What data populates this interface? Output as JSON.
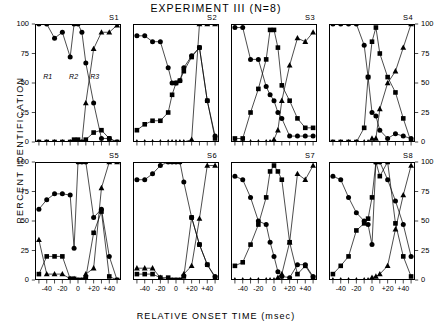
{
  "figure": {
    "title": "EXPERIMENT III (N=8)",
    "ylabel": "PERCENT IDENTIFICATION",
    "xlabel": "RELATIVE ONSET TIME (msec)",
    "ytick_labels": [
      "100",
      "75",
      "50",
      "25",
      "0"
    ],
    "ytick_values": [
      100,
      75,
      50,
      25,
      0
    ],
    "xtick_labels": [
      "-40",
      "-20",
      "0",
      "+20",
      "+40"
    ],
    "xtick_values": [
      -40,
      -20,
      0,
      20,
      40
    ],
    "region_labels": [
      "R1",
      "R2",
      "R3"
    ],
    "marker_names": [
      "circle",
      "square",
      "triangle"
    ]
  },
  "chart_data": {
    "type": "line",
    "title": "EXPERIMENT III (N=8)",
    "xlabel": "RELATIVE ONSET TIME (msec)",
    "ylabel": "PERCENT IDENTIFICATION",
    "xlim": [
      -55,
      55
    ],
    "ylim": [
      0,
      100
    ],
    "grid": false,
    "legend": "none",
    "annotations": [
      "R1",
      "R2",
      "R3"
    ],
    "x": [
      -50,
      -40,
      -30,
      -20,
      -10,
      -5,
      0,
      5,
      10,
      20,
      30,
      40,
      50
    ],
    "panels": [
      {
        "name": "S1",
        "series": [
          {
            "name": "R1",
            "marker": "circle",
            "values": [
              100,
              100,
              88,
              93,
              72,
              100,
              100,
              93,
              67,
              33,
              3,
              3,
              0
            ]
          },
          {
            "name": "R2",
            "marker": "square",
            "values": [
              0,
              0,
              0,
              0,
              0,
              2,
              2,
              0,
              2,
              8,
              10,
              3,
              0
            ]
          },
          {
            "name": "R3",
            "marker": "triangle",
            "values": [
              0,
              0,
              0,
              0,
              0,
              0,
              0,
              0,
              33,
              79,
              93,
              93,
              99
            ]
          }
        ]
      },
      {
        "name": "S2",
        "series": [
          {
            "name": "R1",
            "marker": "circle",
            "values": [
              90,
              90,
              85,
              85,
              63,
              50,
              50,
              52,
              63,
              73,
              80,
              35,
              5
            ]
          },
          {
            "name": "R2",
            "marker": "square",
            "values": [
              10,
              15,
              18,
              18,
              25,
              40,
              50,
              52,
              60,
              72,
              80,
              35,
              3
            ]
          },
          {
            "name": "R3",
            "marker": "triangle",
            "values": [
              0,
              0,
              0,
              0,
              0,
              0,
              0,
              0,
              0,
              2,
              100,
              100,
              100
            ]
          }
        ]
      },
      {
        "name": "S3",
        "series": [
          {
            "name": "R1",
            "marker": "circle",
            "values": [
              97,
              97,
              70,
              70,
              47,
              40,
              35,
              25,
              20,
              5,
              5,
              5,
              5
            ]
          },
          {
            "name": "R2",
            "marker": "square",
            "values": [
              3,
              3,
              25,
              45,
              70,
              95,
              95,
              80,
              48,
              35,
              20,
              12,
              12
            ]
          },
          {
            "name": "R3",
            "marker": "triangle",
            "values": [
              0,
              0,
              0,
              0,
              0,
              0,
              2,
              10,
              35,
              65,
              88,
              85,
              93
            ]
          }
        ]
      },
      {
        "name": "S4",
        "series": [
          {
            "name": "R1",
            "marker": "circle",
            "values": [
              100,
              100,
              100,
              100,
              82,
              55,
              25,
              22,
              10,
              3,
              7,
              5,
              3
            ]
          },
          {
            "name": "R2",
            "marker": "square",
            "values": [
              0,
              0,
              0,
              0,
              12,
              55,
              85,
              97,
              75,
              55,
              42,
              20,
              0
            ]
          },
          {
            "name": "R3",
            "marker": "triangle",
            "values": [
              0,
              0,
              0,
              0,
              0,
              0,
              3,
              3,
              28,
              50,
              60,
              80,
              100
            ]
          }
        ]
      },
      {
        "name": "S5",
        "series": [
          {
            "name": "R1",
            "marker": "circle",
            "values": [
              60,
              68,
              73,
              73,
              72,
              27,
              100,
              100,
              100,
              53,
              60,
              20,
              0
            ]
          },
          {
            "name": "R2",
            "marker": "square",
            "values": [
              5,
              20,
              20,
              20,
              1,
              1,
              0,
              0,
              2,
              40,
              58,
              3,
              0
            ]
          },
          {
            "name": "R3",
            "marker": "triangle",
            "values": [
              34,
              5,
              5,
              5,
              1,
              1,
              0,
              0,
              5,
              10,
              78,
              100,
              100
            ]
          }
        ]
      },
      {
        "name": "S6",
        "series": [
          {
            "name": "R1",
            "marker": "circle",
            "values": [
              85,
              85,
              90,
              97,
              100,
              100,
              100,
              100,
              83,
              53,
              30,
              13,
              3
            ]
          },
          {
            "name": "R2",
            "marker": "square",
            "values": [
              5,
              5,
              5,
              2,
              2,
              0,
              0,
              0,
              3,
              53,
              30,
              13,
              2
            ]
          },
          {
            "name": "R3",
            "marker": "triangle",
            "values": [
              10,
              10,
              10,
              2,
              0,
              0,
              0,
              0,
              5,
              12,
              52,
              97,
              97
            ]
          }
        ]
      },
      {
        "name": "S7",
        "series": [
          {
            "name": "R1",
            "marker": "circle",
            "values": [
              88,
              85,
              70,
              50,
              47,
              32,
              20,
              7,
              3,
              2,
              13,
              13,
              3
            ]
          },
          {
            "name": "R2",
            "marker": "square",
            "values": [
              12,
              15,
              30,
              47,
              70,
              92,
              97,
              92,
              85,
              32,
              5,
              12,
              2
            ]
          },
          {
            "name": "R3",
            "marker": "triangle",
            "values": [
              0,
              0,
              0,
              0,
              0,
              0,
              0,
              2,
              5,
              32,
              90,
              85,
              97
            ]
          }
        ]
      },
      {
        "name": "S8",
        "series": [
          {
            "name": "R1",
            "marker": "circle",
            "values": [
              88,
              85,
              70,
              57,
              50,
              47,
              30,
              100,
              100,
              85,
              67,
              47,
              20
            ]
          },
          {
            "name": "R2",
            "marker": "square",
            "values": [
              5,
              12,
              20,
              42,
              48,
              52,
              70,
              100,
              88,
              100,
              48,
              20,
              3
            ]
          },
          {
            "name": "R3",
            "marker": "triangle",
            "values": [
              0,
              0,
              0,
              0,
              0,
              0,
              2,
              3,
              5,
              12,
              43,
              72,
              97
            ]
          }
        ]
      }
    ]
  }
}
